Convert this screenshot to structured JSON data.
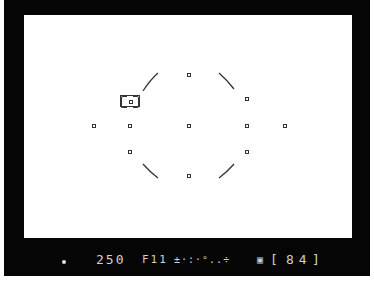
{
  "viewfinder": {
    "background_color": "#ffffff",
    "frame_color": "#050505",
    "af_points": [
      {
        "x": 189,
        "y": 75
      },
      {
        "x": 247,
        "y": 99
      },
      {
        "x": 94,
        "y": 126
      },
      {
        "x": 130,
        "y": 126
      },
      {
        "x": 189,
        "y": 126
      },
      {
        "x": 247,
        "y": 126
      },
      {
        "x": 285,
        "y": 126
      },
      {
        "x": 130,
        "y": 152
      },
      {
        "x": 247,
        "y": 152
      },
      {
        "x": 189,
        "y": 176
      }
    ],
    "selected_af_point": {
      "x": 130,
      "y": 101
    }
  },
  "status_bar": {
    "indicator_icon": "focus-indicator-dot",
    "shutter_speed": "250",
    "aperture": "F11",
    "exposure_indicator": "+/- scale",
    "metering_icon": "metering-mode-icon",
    "frame_count_prefix": "[",
    "frame_count": "84",
    "frame_count_suffix": "]"
  }
}
